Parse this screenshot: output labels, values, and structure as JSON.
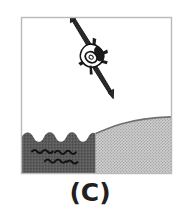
{
  "figure": {
    "caption": "(C)",
    "panel_label": "C",
    "frame": {
      "x": 21,
      "y": 17,
      "width": 151,
      "height": 157,
      "border_color": "#b9b9b9",
      "fill_color": "#ffffff"
    },
    "scene": {
      "sky": {
        "label": "sky",
        "color": "#ffffff"
      },
      "aircraft": {
        "label": "aircraft",
        "orientation": "diving nose-down to the lower right",
        "stroke_color": "#1a1a1a",
        "fill_color": "#ffffff",
        "parts": [
          "fuselage",
          "swept-wings",
          "tailfin",
          "canopy",
          "engine-nacelle"
        ]
      },
      "water": {
        "label": "water",
        "color": "#585858",
        "edge": "scalloped wave crests",
        "wave_mark_color": "#111111",
        "wave_rows": 2
      },
      "hill": {
        "label": "hill",
        "color": "#c9c9c9",
        "texture": "stipple dots",
        "texture_color": "#9a9a9a",
        "outline_color": "#6b6b6b",
        "profile": "convex slope rising to the right"
      }
    }
  }
}
